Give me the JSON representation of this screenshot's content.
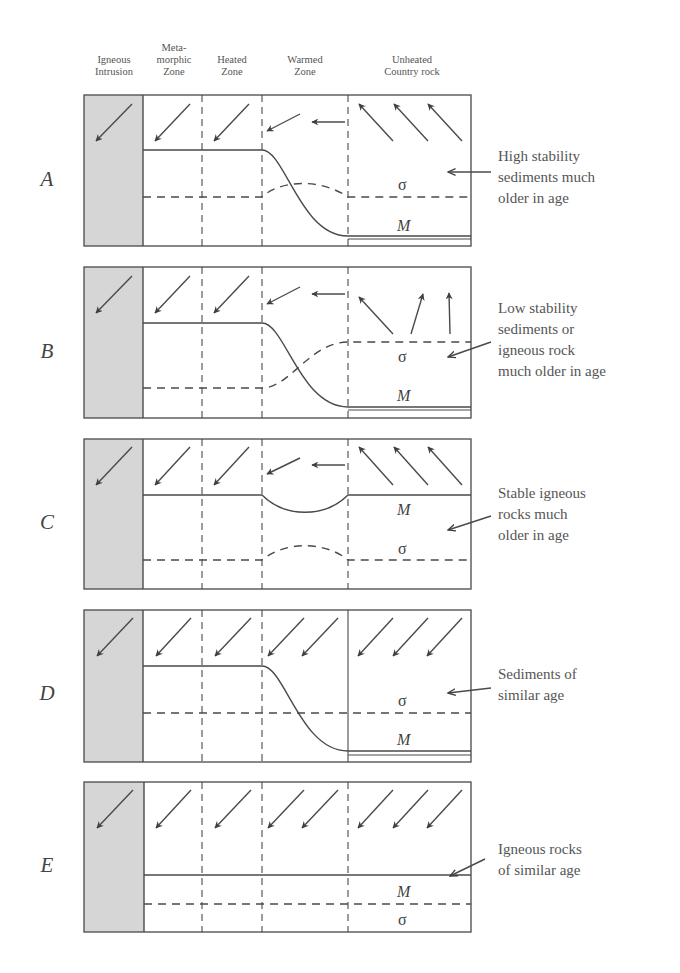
{
  "column_headers": [
    {
      "id": "igneous-intrusion",
      "lines": [
        "Igneous",
        "Intrusion"
      ]
    },
    {
      "id": "metamorphic-zone",
      "lines": [
        "Meta-",
        "morphic",
        "Zone"
      ]
    },
    {
      "id": "heated-zone",
      "lines": [
        "Heated",
        "Zone"
      ]
    },
    {
      "id": "warmed-zone",
      "lines": [
        "Warmed",
        "Zone"
      ]
    },
    {
      "id": "unheated-country-rock",
      "lines": [
        "Unheated",
        "Country rock"
      ]
    }
  ],
  "symbols": {
    "magnetization": "M",
    "stability": "σ"
  },
  "colors": {
    "intrusion_fill": "#d6d6d6",
    "line": "#4a4a4a",
    "border": "#555555"
  },
  "panels": [
    {
      "letter": "A",
      "description": [
        "High stability",
        "sediments much",
        "older in age"
      ]
    },
    {
      "letter": "B",
      "description": [
        "Low stability",
        "sediments or",
        "igneous rock",
        "much older in age"
      ]
    },
    {
      "letter": "C",
      "description": [
        "Stable igneous",
        "rocks much",
        "older in age"
      ]
    },
    {
      "letter": "D",
      "description": [
        "Sediments of",
        "similar age"
      ]
    },
    {
      "letter": "E",
      "description": [
        "Igneous rocks",
        "of similar age"
      ]
    }
  ]
}
